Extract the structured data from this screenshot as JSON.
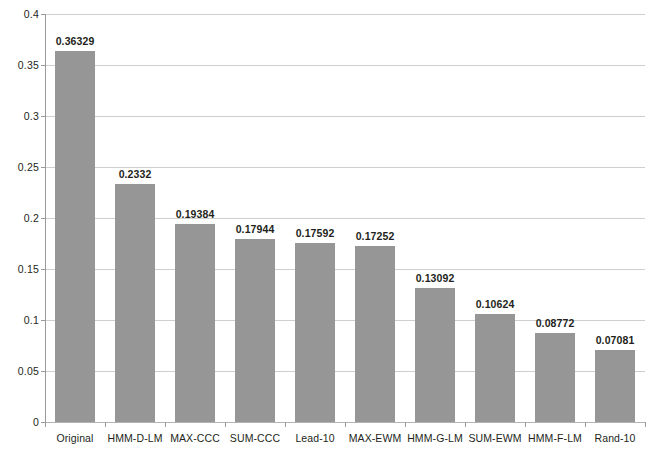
{
  "chart_data": {
    "type": "bar",
    "title": "",
    "xlabel": "",
    "ylabel": "",
    "ylim": [
      0,
      0.4
    ],
    "grid": true,
    "legend": "none",
    "orientation": "vertical",
    "bar_color": "#969696",
    "gridline_color": "#cfcfcf",
    "axis_color": "#9a9a9a",
    "text_color": "#231f20",
    "categories": [
      "Original",
      "HMM-D-LM",
      "MAX-CCC",
      "SUM-CCC",
      "Lead-10",
      "MAX-EWM",
      "HMM-G-LM",
      "SUM-EWM",
      "HMM-F-LM",
      "Rand-10"
    ],
    "values": [
      0.36329,
      0.2332,
      0.19384,
      0.17944,
      0.17592,
      0.17252,
      0.13092,
      0.10624,
      0.08772,
      0.07081
    ],
    "value_labels": [
      "0.36329",
      "0.2332",
      "0.19384",
      "0.17944",
      "0.17592",
      "0.17252",
      "0.13092",
      "0.10624",
      "0.08772",
      "0.07081"
    ],
    "y_ticks": [
      0,
      0.05,
      0.1,
      0.15,
      0.2,
      0.25,
      0.3,
      0.35,
      0.4
    ],
    "y_tick_labels": [
      "0",
      "0.05",
      "0.1",
      "0.15",
      "0.2",
      "0.25",
      "0.3",
      "0.35",
      "0.4"
    ]
  }
}
